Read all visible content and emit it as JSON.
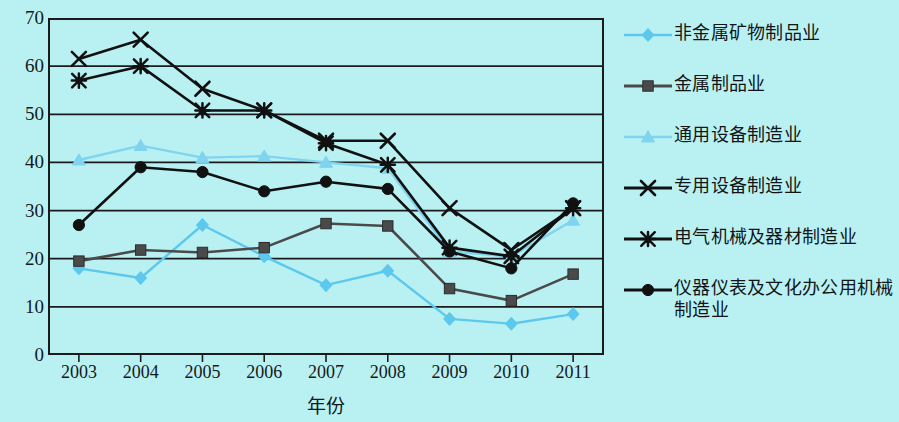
{
  "chart_data": {
    "type": "line",
    "title": "",
    "xlabel": "年份",
    "ylabel": "",
    "ylim": [
      0,
      70
    ],
    "yticks": [
      0,
      10,
      20,
      30,
      40,
      50,
      60,
      70
    ],
    "grid": true,
    "legend_position": "right",
    "categories": [
      "2003",
      "2004",
      "2005",
      "2006",
      "2007",
      "2008",
      "2009",
      "2010",
      "2011"
    ],
    "series": [
      {
        "name": "非金属矿物制品业",
        "marker": "diamond",
        "color": "#5cc8ee",
        "values": [
          18,
          16,
          27,
          20.5,
          14.5,
          17.5,
          7.5,
          6.5,
          8.5
        ]
      },
      {
        "name": "金属制品业",
        "marker": "square",
        "color": "#4a4a4a",
        "values": [
          19.5,
          21.8,
          21.3,
          22.3,
          27.3,
          26.8,
          13.8,
          11.3,
          16.8
        ]
      },
      {
        "name": "通用设备制造业",
        "marker": "triangle",
        "color": "#7fd4f0",
        "values": [
          40.5,
          43.5,
          41,
          41.3,
          40,
          38.8,
          21.5,
          20.5,
          28
        ]
      },
      {
        "name": "专用设备制造业",
        "marker": "x",
        "color": "#111111",
        "values": [
          61.5,
          65.5,
          55.3,
          50.8,
          44.5,
          44.5,
          30.5,
          21.8,
          30.5
        ]
      },
      {
        "name": "电气机械及器材制造业",
        "marker": "asterisk",
        "color": "#111111",
        "values": [
          57,
          60,
          50.8,
          50.8,
          44,
          39.5,
          22.3,
          20.5,
          30.5
        ]
      },
      {
        "name": "仪器仪表及文化办公用机械\n制造业",
        "marker": "circle",
        "color": "#111111",
        "values": [
          27,
          39,
          38,
          34,
          36,
          34.5,
          21.5,
          18,
          31.5
        ]
      }
    ]
  },
  "colors": {
    "background": "#b9f1f3",
    "axis": "#1b1b1b",
    "gridline": "#1b1b1b"
  }
}
